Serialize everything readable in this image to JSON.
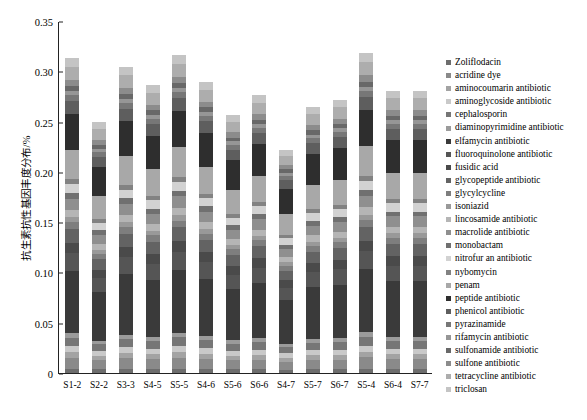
{
  "chart_data": {
    "type": "bar",
    "stacked": true,
    "title": "",
    "subtitle": "",
    "xlabel": "",
    "ylabel": "抗生素抗性基因丰度分布/%",
    "ylim": [
      0,
      0.35
    ],
    "ytick_labels": [
      "0",
      "0.05",
      "0.10",
      "0.15",
      "0.20",
      "0.25",
      "0.30",
      "0.35"
    ],
    "ytick_values": [
      0,
      0.05,
      0.1,
      0.15,
      0.2,
      0.25,
      0.3,
      0.35
    ],
    "grid": false,
    "legend_position": "right",
    "categories": [
      "S1-2",
      "S2-2",
      "S3-3",
      "S4-5",
      "S5-5",
      "S4-6",
      "S5-6",
      "S6-6",
      "S4-7",
      "S5-7",
      "S6-7",
      "S5-4",
      "S6-4",
      "S7-7"
    ],
    "totals": [
      0.303,
      0.242,
      0.296,
      0.278,
      0.306,
      0.281,
      0.249,
      0.268,
      0.217,
      0.256,
      0.262,
      0.307,
      0.272,
      0.272
    ],
    "series": [
      {
        "name": "Zoliflodacin",
        "color": "#6d6d6d",
        "values": [
          0.004,
          0.0035,
          0.004,
          0.0038,
          0.0042,
          0.0038,
          0.0035,
          0.0036,
          0.003,
          0.0035,
          0.0036,
          0.0042,
          0.0037,
          0.0037
        ]
      },
      {
        "name": "acridine dye",
        "color": "#8a8a8a",
        "values": [
          0.011,
          0.009,
          0.0105,
          0.01,
          0.0112,
          0.0102,
          0.0092,
          0.0096,
          0.0082,
          0.0094,
          0.0096,
          0.0113,
          0.01,
          0.01
        ]
      },
      {
        "name": "aminocoumarin antibiotic",
        "color": "#a3a3a3",
        "values": [
          0.0055,
          0.0045,
          0.0053,
          0.005,
          0.0056,
          0.0051,
          0.0046,
          0.0048,
          0.0041,
          0.0047,
          0.0048,
          0.0056,
          0.005,
          0.005
        ]
      },
      {
        "name": "aminoglycoside antibiotic",
        "color": "#c9c9c9",
        "values": [
          0.006,
          0.0048,
          0.0058,
          0.0055,
          0.0061,
          0.0056,
          0.005,
          0.0053,
          0.0045,
          0.0051,
          0.0052,
          0.0061,
          0.0054,
          0.0054
        ]
      },
      {
        "name": "cephalosporin",
        "color": "#767676",
        "values": [
          0.0085,
          0.0068,
          0.0083,
          0.0078,
          0.0086,
          0.0079,
          0.007,
          0.0075,
          0.006,
          0.0072,
          0.0074,
          0.0086,
          0.0077,
          0.0077
        ]
      },
      {
        "name": "diaminopyrimidine antibiotic",
        "color": "#9b9b9b",
        "values": [
          0.0045,
          0.0036,
          0.0044,
          0.0041,
          0.0046,
          0.0042,
          0.0037,
          0.004,
          0.0032,
          0.0038,
          0.0039,
          0.0046,
          0.0041,
          0.0041
        ]
      },
      {
        "name": "elfamycin antibiotic",
        "color": "#3a3a3a",
        "values": [
          0.062,
          0.048,
          0.06,
          0.0565,
          0.0625,
          0.0572,
          0.0505,
          0.0545,
          0.0435,
          0.052,
          0.0535,
          0.0628,
          0.0553,
          0.0553
        ]
      },
      {
        "name": "fluoroquinolone antibiotic",
        "color": "#555555",
        "values": [
          0.0175,
          0.014,
          0.017,
          0.016,
          0.0177,
          0.0162,
          0.0143,
          0.0154,
          0.0124,
          0.0148,
          0.0152,
          0.0178,
          0.0157,
          0.0157
        ]
      },
      {
        "name": "fusidic acid",
        "color": "#4a4a4a",
        "values": [
          0.0105,
          0.0084,
          0.0102,
          0.0096,
          0.0106,
          0.0097,
          0.0086,
          0.0093,
          0.0074,
          0.0089,
          0.0091,
          0.0107,
          0.0094,
          0.0094
        ]
      },
      {
        "name": "glycopeptide antibiotic",
        "color": "#636363",
        "values": [
          0.0135,
          0.0108,
          0.0132,
          0.0124,
          0.0137,
          0.0125,
          0.0111,
          0.012,
          0.0096,
          0.0114,
          0.0117,
          0.0137,
          0.0121,
          0.0121
        ]
      },
      {
        "name": "glycylcycline",
        "color": "#7e7e7e",
        "values": [
          0.0068,
          0.0054,
          0.0066,
          0.0062,
          0.0069,
          0.0063,
          0.0056,
          0.006,
          0.0048,
          0.0058,
          0.0059,
          0.0069,
          0.0061,
          0.0061
        ]
      },
      {
        "name": "isoniazid",
        "color": "#999999",
        "values": [
          0.005,
          0.004,
          0.0049,
          0.0046,
          0.0051,
          0.0046,
          0.0041,
          0.0044,
          0.0036,
          0.0042,
          0.0044,
          0.0051,
          0.0045,
          0.0045
        ]
      },
      {
        "name": "lincosamide antibiotic",
        "color": "#b5b5b5",
        "values": [
          0.0072,
          0.0058,
          0.007,
          0.0066,
          0.0073,
          0.0067,
          0.0059,
          0.0064,
          0.0051,
          0.0061,
          0.0063,
          0.0073,
          0.0065,
          0.0065
        ]
      },
      {
        "name": "macrolide antibiotic",
        "color": "#8f8f8f",
        "values": [
          0.0115,
          0.0092,
          0.0112,
          0.0105,
          0.0116,
          0.0106,
          0.0094,
          0.0102,
          0.0082,
          0.0097,
          0.01,
          0.0117,
          0.0103,
          0.0103
        ]
      },
      {
        "name": "monobactam",
        "color": "#707070",
        "values": [
          0.0055,
          0.0044,
          0.0053,
          0.005,
          0.0056,
          0.0051,
          0.0045,
          0.0049,
          0.0039,
          0.0047,
          0.0048,
          0.0056,
          0.0049,
          0.0049
        ]
      },
      {
        "name": "nitrofur an antibiotic",
        "color": "#d2d2d2",
        "values": [
          0.009,
          0.0072,
          0.0088,
          0.0083,
          0.0091,
          0.0083,
          0.0074,
          0.008,
          0.0064,
          0.0076,
          0.0078,
          0.0091,
          0.0081,
          0.0081
        ]
      },
      {
        "name": "nybomycin",
        "color": "#828282",
        "values": [
          0.0048,
          0.0038,
          0.0047,
          0.0044,
          0.0048,
          0.0044,
          0.0039,
          0.0042,
          0.0034,
          0.0041,
          0.0042,
          0.0049,
          0.0043,
          0.0043
        ]
      },
      {
        "name": "penam",
        "color": "#a8a8a8",
        "values": [
          0.029,
          0.0232,
          0.0283,
          0.0266,
          0.0293,
          0.0269,
          0.0238,
          0.0256,
          0.0205,
          0.0245,
          0.0251,
          0.0294,
          0.026,
          0.026
        ]
      },
      {
        "name": "peptide antibiotic",
        "color": "#2e2e2e",
        "values": [
          0.036,
          0.0288,
          0.0352,
          0.033,
          0.0363,
          0.0334,
          0.0296,
          0.0319,
          0.0255,
          0.0305,
          0.0312,
          0.0365,
          0.0323,
          0.0323
        ]
      },
      {
        "name": "phenicol antibiotic",
        "color": "#5e5e5e",
        "values": [
          0.0125,
          0.01,
          0.0122,
          0.0115,
          0.0126,
          0.0116,
          0.0103,
          0.0111,
          0.0088,
          0.0106,
          0.0108,
          0.0127,
          0.0112,
          0.0112
        ]
      },
      {
        "name": "pyrazinamide",
        "color": "#777777",
        "values": [
          0.0062,
          0.005,
          0.0061,
          0.0057,
          0.0063,
          0.0058,
          0.0051,
          0.0055,
          0.0044,
          0.0053,
          0.0054,
          0.0063,
          0.0056,
          0.0056
        ]
      },
      {
        "name": "rifamycin antibiotic",
        "color": "#969696",
        "values": [
          0.004,
          0.0032,
          0.0039,
          0.0037,
          0.004,
          0.0037,
          0.0033,
          0.0035,
          0.0028,
          0.0034,
          0.0035,
          0.0041,
          0.0036,
          0.0036
        ]
      },
      {
        "name": "sulfonamide antibiotic",
        "color": "#686868",
        "values": [
          0.0048,
          0.0038,
          0.0047,
          0.0044,
          0.0048,
          0.0044,
          0.0039,
          0.0042,
          0.0034,
          0.0041,
          0.0042,
          0.0049,
          0.0043,
          0.0043
        ]
      },
      {
        "name": "sulfone antibiotic",
        "color": "#8c8c8c",
        "values": [
          0.0062,
          0.005,
          0.0061,
          0.0057,
          0.0063,
          0.0058,
          0.0051,
          0.0055,
          0.0044,
          0.0053,
          0.0054,
          0.0063,
          0.0056,
          0.0056
        ]
      },
      {
        "name": "tetracycline antibiotic",
        "color": "#adadad",
        "values": [
          0.013,
          0.0104,
          0.0127,
          0.0119,
          0.0131,
          0.012,
          0.0107,
          0.0115,
          0.0092,
          0.011,
          0.0112,
          0.0132,
          0.0117,
          0.0117
        ]
      },
      {
        "name": "triclosan",
        "color": "#c4c4c4",
        "values": [
          0.0085,
          0.0068,
          0.0083,
          0.0078,
          0.0086,
          0.0079,
          0.007,
          0.0075,
          0.006,
          0.0072,
          0.0073,
          0.0086,
          0.0076,
          0.0076
        ]
      }
    ]
  },
  "legend": {
    "items": [
      {
        "label": "Zoliflodacin",
        "color": "#6d6d6d"
      },
      {
        "label": "acridine dye",
        "color": "#8a8a8a"
      },
      {
        "label": "aminocoumarin antibiotic",
        "color": "#a3a3a3"
      },
      {
        "label": "aminoglycoside antibiotic",
        "color": "#c9c9c9"
      },
      {
        "label": "cephalosporin",
        "color": "#767676"
      },
      {
        "label": "diaminopyrimidine antibiotic",
        "color": "#9b9b9b"
      },
      {
        "label": "elfamycin antibiotic",
        "color": "#3a3a3a"
      },
      {
        "label": "fluoroquinolone antibiotic",
        "color": "#555555"
      },
      {
        "label": "fusidic acid",
        "color": "#4a4a4a"
      },
      {
        "label": "glycopeptide antibiotic",
        "color": "#636363"
      },
      {
        "label": "glycylcycline",
        "color": "#7e7e7e"
      },
      {
        "label": "isoniazid",
        "color": "#999999"
      },
      {
        "label": "lincosamide antibiotic",
        "color": "#b5b5b5"
      },
      {
        "label": "macrolide antibiotic",
        "color": "#8f8f8f"
      },
      {
        "label": "monobactam",
        "color": "#707070"
      },
      {
        "label": "nitrofur an antibiotic",
        "color": "#d2d2d2"
      },
      {
        "label": "nybomycin",
        "color": "#828282"
      },
      {
        "label": "penam",
        "color": "#a8a8a8"
      },
      {
        "label": "peptide antibiotic",
        "color": "#2e2e2e"
      },
      {
        "label": "phenicol antibiotic",
        "color": "#5e5e5e"
      },
      {
        "label": "pyrazinamide",
        "color": "#777777"
      },
      {
        "label": "rifamycin antibiotic",
        "color": "#969696"
      },
      {
        "label": "sulfonamide antibiotic",
        "color": "#686868"
      },
      {
        "label": "sulfone antibiotic",
        "color": "#8c8c8c"
      },
      {
        "label": "tetracycline antibiotic",
        "color": "#adadad"
      },
      {
        "label": "triclosan",
        "color": "#c4c4c4"
      }
    ]
  }
}
